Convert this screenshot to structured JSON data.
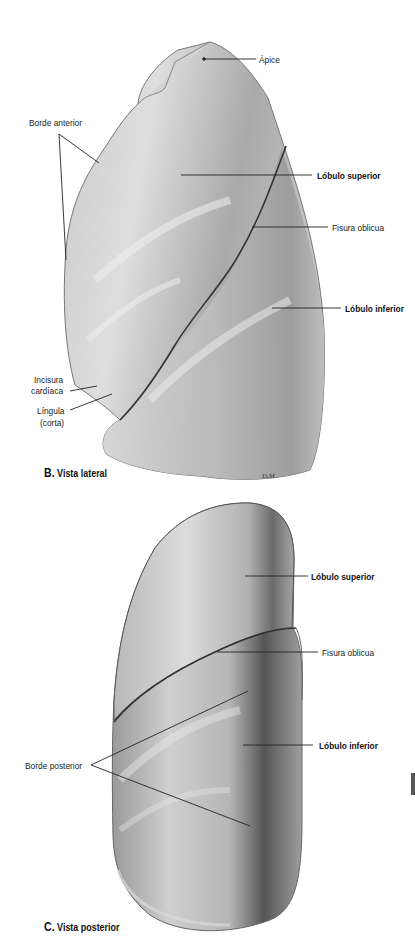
{
  "figure_b": {
    "caption_letter": "B.",
    "caption_text": "Vista lateral",
    "labels": {
      "apex": "Ápice",
      "anterior_border": "Borde anterior",
      "upper_lobe": "Lóbulo superior",
      "oblique_fissure": "Fisura oblicua",
      "lower_lobe": "Lóbulo inferior",
      "cardiac_notch_1": "Incisura",
      "cardiac_notch_2": "cardíaca",
      "lingula_1": "Língula",
      "lingula_2": "(corta)"
    },
    "signature": "D.M."
  },
  "figure_c": {
    "caption_letter": "C.",
    "caption_text": "Vista posterior",
    "labels": {
      "upper_lobe": "Lóbulo superior",
      "oblique_fissure": "Fisura oblicua",
      "lower_lobe": "Lóbulo inferior",
      "posterior_border": "Borde posterior"
    }
  },
  "colors": {
    "lung_light": "#d9d9d9",
    "lung_mid": "#a8a8a8",
    "lung_dark": "#6e6e6e",
    "leader_line": "#222222"
  }
}
